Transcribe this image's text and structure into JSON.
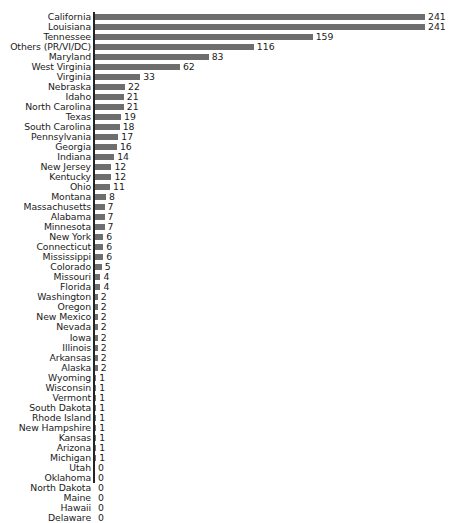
{
  "chart_data": {
    "type": "bar",
    "orientation": "horizontal",
    "title": "",
    "subtitle": "",
    "xlabel": "",
    "ylabel": "",
    "xlim": [
      0,
      241
    ],
    "grid": false,
    "legend": null,
    "bar_color": "#6e6e6e",
    "axis_color": "#242424",
    "background_color": "#ffffff",
    "value_labels_shown": true,
    "categories": [
      "California",
      "Louisiana",
      "Tennessee",
      "Others (PR/VI/DC)",
      "Maryland",
      "West Virginia",
      "Virginia",
      "Nebraska",
      "Idaho",
      "North Carolina",
      "Texas",
      "South Carolina",
      "Pennsylvania",
      "Georgia",
      "Indiana",
      "New Jersey",
      "Kentucky",
      "Ohio",
      "Montana",
      "Massachusetts",
      "Alabama",
      "Minnesota",
      "New York",
      "Connecticut",
      "Mississippi",
      "Colorado",
      "Missouri",
      "Florida",
      "Washington",
      "Oregon",
      "New Mexico",
      "Nevada",
      "Iowa",
      "Illinois",
      "Arkansas",
      "Alaska",
      "Wyoming",
      "Wisconsin",
      "Vermont",
      "South Dakota",
      "Rhode Island",
      "New Hampshire",
      "Kansas",
      "Arizona",
      "Michigan",
      "Utah",
      "Oklahoma",
      "North Dakota",
      "Maine",
      "Hawaii",
      "Delaware"
    ],
    "values": [
      241,
      241,
      159,
      116,
      83,
      62,
      33,
      22,
      21,
      21,
      19,
      18,
      17,
      16,
      14,
      12,
      12,
      11,
      8,
      7,
      7,
      7,
      6,
      6,
      6,
      5,
      4,
      4,
      2,
      2,
      2,
      2,
      2,
      2,
      2,
      2,
      1,
      1,
      1,
      1,
      1,
      1,
      1,
      1,
      1,
      0,
      0,
      0,
      0,
      0,
      0
    ]
  }
}
